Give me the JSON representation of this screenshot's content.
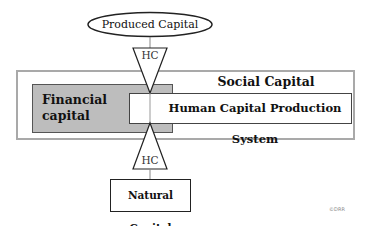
{
  "diagram": {
    "nodes": {
      "produced_capital": {
        "label": "Produced Capital",
        "shape": "ellipse"
      },
      "social_capital": {
        "label": "Social Capital",
        "shape": "rectangle"
      },
      "financial_capital": {
        "label": "Financial capital",
        "line1": "Financial",
        "line2": "capital",
        "shape": "rectangle",
        "fill": "#bdbdbd"
      },
      "hcps": {
        "label": "Human Capital Production System",
        "shape": "rectangle"
      },
      "natural_capital": {
        "label": "Natural Capital",
        "shape": "rectangle"
      }
    },
    "connectors": [
      {
        "from": "produced_capital",
        "to": "hcps",
        "label": "HC",
        "shape": "triangle-down"
      },
      {
        "from": "natural_capital",
        "to": "hcps",
        "label": "HC",
        "shape": "triangle-up"
      }
    ],
    "copyright": "©DRR"
  },
  "colors": {
    "outer_border": "#a9a9a9",
    "financial_fill": "#bdbdbd",
    "line": "#222222"
  }
}
